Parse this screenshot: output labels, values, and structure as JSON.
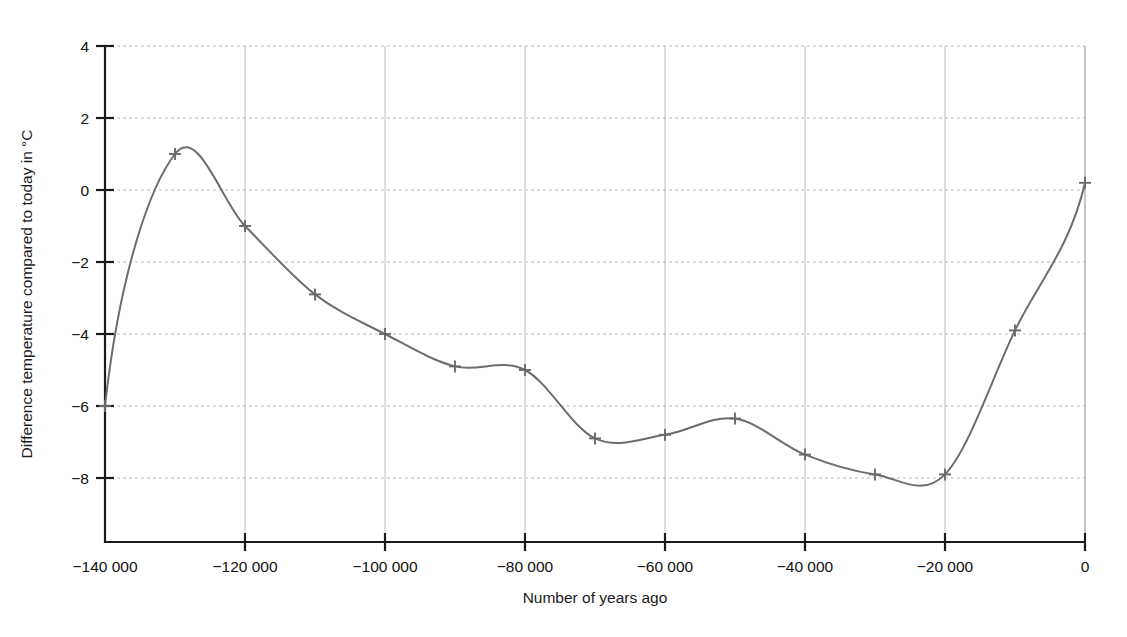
{
  "chart_data": {
    "type": "line",
    "title": "",
    "xlabel": "Number of years ago",
    "ylabel": "Difference temperature compared to today in °C",
    "xlim": [
      -140000,
      0
    ],
    "ylim": [
      -9,
      4
    ],
    "grid": true,
    "legend": "none",
    "x_ticks": [
      -140000,
      -120000,
      -100000,
      -80000,
      -60000,
      -40000,
      -20000,
      0
    ],
    "x_tick_labels": [
      "−140 000",
      "−120 000",
      "−100 000",
      "−80 000",
      "−60 000",
      "−40 000",
      "−20 000",
      "0"
    ],
    "y_ticks": [
      4,
      2,
      0,
      -2,
      -4,
      -6,
      -8
    ],
    "y_tick_labels": [
      "4",
      "2",
      "0",
      "−2",
      "−4",
      "−6",
      "−8"
    ],
    "series": [
      {
        "name": "Temperature difference",
        "color": "#6d6d6d",
        "marker": "plus",
        "x": [
          -140000,
          -130000,
          -120000,
          -110000,
          -100000,
          -90000,
          -80000,
          -70000,
          -60000,
          -50000,
          -40000,
          -30000,
          -20000,
          -10000,
          0
        ],
        "values": [
          -6.0,
          1.0,
          -1.0,
          -2.9,
          -4.0,
          -4.9,
          -5.0,
          -6.9,
          -6.8,
          -6.35,
          -7.35,
          -7.9,
          -7.9,
          -3.9,
          0.2
        ]
      }
    ],
    "annotations": [
      {
        "text": "peak near −127 000 at about +1.55 °C"
      },
      {
        "text": "minimum near −24 000 at about −8.15 °C"
      },
      {
        "text": "local minimum near −65 000 at about −7.1 °C"
      }
    ]
  },
  "axes": {
    "x_axis_label": "Number of years ago",
    "y_axis_label": "Difference temperature compared to today in °C"
  },
  "colors": {
    "curve": "#6d6d6d",
    "grid": "#9b9bb0",
    "axis": "#1a1a1a",
    "background": "#ffffff"
  }
}
